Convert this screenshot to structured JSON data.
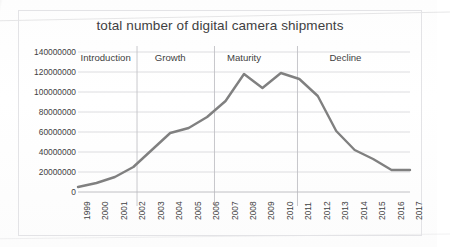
{
  "chart_data": {
    "type": "line",
    "title": "total number of digital camera shipments",
    "xlabel": "",
    "ylabel": "",
    "grid": true,
    "legend": false,
    "xlim": [
      1999,
      2017
    ],
    "ylim": [
      0,
      140000000
    ],
    "categories": [
      "1999",
      "2000",
      "2001",
      "2002",
      "2003",
      "2004",
      "2005",
      "2006",
      "2007",
      "2008",
      "2009",
      "2010",
      "2011",
      "2012",
      "2013",
      "2014",
      "2015",
      "2016",
      "2017"
    ],
    "values": [
      5000000,
      9000000,
      15000000,
      25000000,
      42000000,
      59000000,
      64000000,
      75000000,
      91000000,
      118000000,
      104000000,
      119000000,
      113000000,
      96000000,
      61000000,
      42000000,
      33000000,
      22000000,
      22000000
    ],
    "ytick_labels": [
      "140000000",
      "120000000",
      "100000000",
      "80000000",
      "60000000",
      "40000000",
      "20000000",
      "0"
    ],
    "ytick_values": [
      140000000,
      120000000,
      100000000,
      80000000,
      60000000,
      40000000,
      20000000,
      0
    ],
    "series_color": "#808080",
    "gridline_color": "#d9d9dc",
    "annotations": [
      {
        "label": "Introduction",
        "start_year": 1999,
        "end_year": 2002
      },
      {
        "label": "Growth",
        "start_year": 2002,
        "end_year": 2006
      },
      {
        "label": "Maturity",
        "start_year": 2006,
        "end_year": 2010
      },
      {
        "label": "Decline",
        "start_year": 2010,
        "end_year": 2017
      }
    ],
    "divider_years": [
      2002.2,
      2006.4,
      2010.9
    ]
  }
}
